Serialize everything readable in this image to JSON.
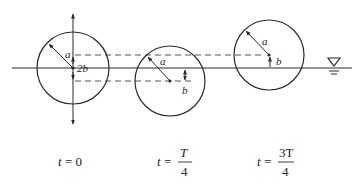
{
  "diagram": {
    "water_line_symbol": "free-surface-triangle",
    "circles": [
      {
        "id": "t0",
        "radius_label": "a",
        "offset_label": "2b",
        "time_label": {
          "prefix": "t = ",
          "value": "0"
        }
      },
      {
        "id": "tT4",
        "radius_label": "a",
        "offset_label": "b",
        "time_label": {
          "prefix": "t = ",
          "numerator": "T",
          "denominator": "4"
        }
      },
      {
        "id": "t3T4",
        "radius_label": "a",
        "offset_label": "b",
        "time_label": {
          "prefix": "t = ",
          "numerator": "3T",
          "denominator": "4"
        }
      }
    ],
    "colors": {
      "stroke": "#2a2a2a",
      "dashed": "#555555",
      "background": "#ffffff"
    }
  }
}
